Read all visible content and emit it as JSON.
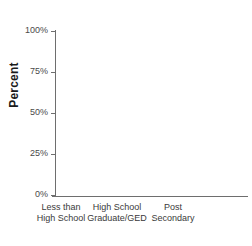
{
  "chart_data": {
    "type": "bar",
    "subtype": "stacked-100-percent",
    "title": "",
    "xlabel": "",
    "ylabel": "Percent",
    "ylim": [
      0,
      100
    ],
    "grid": false,
    "legend": "none",
    "categories": [
      "Less than High School",
      "High School Graduate/GED",
      "Post Secondary"
    ],
    "category_label_lines": [
      [
        "Less than",
        "High School"
      ],
      [
        "High School",
        "Graduate/GED"
      ],
      [
        "Post",
        "Secondary"
      ]
    ],
    "ytick_labels": [
      "0%",
      "25%",
      "50%",
      "75%",
      "100%"
    ],
    "ytick_values": [
      0,
      25,
      50,
      75,
      100
    ],
    "series": [
      {
        "name": "bottom-segment",
        "color": "#c4c4c4",
        "values": [
          34,
          43,
          39
        ]
      },
      {
        "name": "middle-segment",
        "color": "#808080",
        "values": [
          57,
          45,
          44
        ]
      },
      {
        "name": "top-segment",
        "color": "#2b2b2b",
        "values": [
          9,
          12,
          17
        ]
      }
    ]
  },
  "axis": {
    "line_color": "#6e6e6e",
    "tick_color": "#6e6e6e"
  },
  "background": "#ffffff"
}
